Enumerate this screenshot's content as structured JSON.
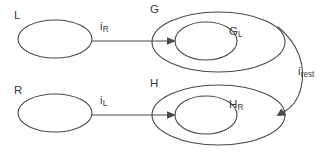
{
  "diagram": {
    "background_color": "#ffffff",
    "stroke_color": "#4a4a4a",
    "text_color": "#3a3a3a",
    "nodes": [
      {
        "id": "L",
        "label": "L",
        "shape": "ellipse",
        "label_position": "top-left-outside"
      },
      {
        "id": "R",
        "label": "R",
        "shape": "ellipse",
        "label_position": "top-left-outside"
      },
      {
        "id": "G",
        "label": "G",
        "shape": "ellipse-outer",
        "label_position": "top-left-outside"
      },
      {
        "id": "G_L",
        "label_base": "G",
        "label_sub": "L",
        "shape": "ellipse-inner",
        "label_position": "right-inside"
      },
      {
        "id": "H",
        "label": "H",
        "shape": "ellipse-outer",
        "label_position": "top-left-outside"
      },
      {
        "id": "H_R",
        "label_base": "H",
        "label_sub": "R",
        "shape": "ellipse-inner",
        "label_position": "right-inside"
      }
    ],
    "edges": [
      {
        "id": "i_R",
        "label_base": "i",
        "label_sub": "R",
        "from": "L",
        "to": "G_L",
        "style": "straight-arrow"
      },
      {
        "id": "i_L",
        "label_base": "i",
        "label_sub": "L",
        "from": "R",
        "to": "H_R",
        "style": "straight-arrow"
      },
      {
        "id": "i_rest",
        "label_base": "i",
        "label_sub": "rest",
        "from": "G",
        "to": "H",
        "style": "curved-arrow"
      }
    ]
  }
}
